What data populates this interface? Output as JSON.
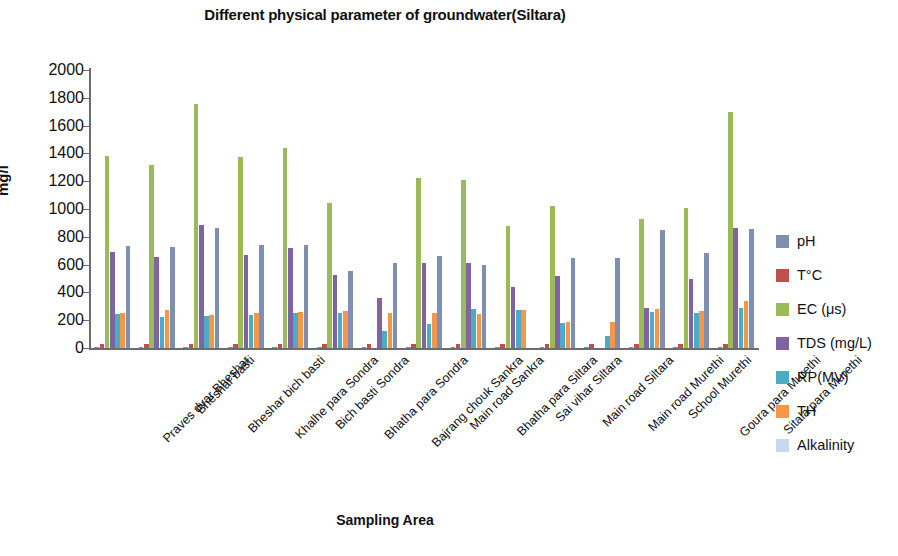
{
  "chart_data": {
    "type": "bar",
    "title": "Different physical parameter of groundwater(Siltara)",
    "xlabel": "Sampling Area",
    "ylabel": "mg/l",
    "ylim": [
      0,
      2000
    ],
    "ytick_step": 200,
    "yticks": [
      2000,
      1800,
      1600,
      1400,
      1200,
      1000,
      800,
      600,
      400,
      200,
      0
    ],
    "grid": false,
    "legend_position": "right",
    "categories": [
      "Praves dvar Bheshar",
      "Bheshar basti",
      "Bheshar bich basti",
      "Khalhe para Sondra",
      "Bich basti Sondra",
      "Bhatha para Sondra",
      "Bajrang chouk Sankra",
      "Main road Sankra",
      "Bhatha para Siltara",
      "Sai vihar Siltara",
      "Main road Siltara",
      "Main road Murethi",
      "School Murethi",
      "Goura para Murethi",
      "Sitala para Murethi"
    ],
    "series": [
      {
        "name": "pH",
        "color": "#7f8fb1",
        "values": [
          7.4,
          7.2,
          7.6,
          7.3,
          7.5,
          7.2,
          7.1,
          7.4,
          7.3,
          7.2,
          7.5,
          7.4,
          7.3,
          7.2,
          7.5
        ]
      },
      {
        "name": "T°C",
        "color": "#c0504d",
        "values": [
          28,
          28,
          29,
          28,
          29,
          28,
          27,
          28,
          28,
          27,
          28,
          28,
          29,
          28,
          29
        ]
      },
      {
        "name": "EC (μs)",
        "color": "#9bbb59",
        "values": [
          1385,
          1315,
          1755,
          1375,
          1440,
          1040,
          0,
          1225,
          1210,
          880,
          1020,
          0,
          930,
          1005,
          1695
        ]
      },
      {
        "name": "TDS (mg/L)",
        "color": "#8064a2",
        "values": [
          690,
          655,
          885,
          670,
          720,
          525,
          360,
          610,
          615,
          440,
          515,
          0,
          285,
          500,
          860
        ]
      },
      {
        "name": "RP(MV)",
        "color": "#4bacc6",
        "values": [
          245,
          225,
          230,
          240,
          250,
          255,
          120,
          175,
          280,
          270,
          180,
          90,
          260,
          255,
          290
        ]
      },
      {
        "name": "TH",
        "color": "#f79646",
        "values": [
          250,
          275,
          235,
          250,
          260,
          265,
          255,
          255,
          245,
          275,
          185,
          185,
          280,
          265,
          335
        ]
      },
      {
        "name": "Alkalinity",
        "color": "#c6d9f0",
        "values": [
          735,
          725,
          860,
          740,
          740,
          555,
          610,
          665,
          600,
          0,
          650,
          650,
          850,
          685,
          855
        ]
      }
    ],
    "note_alkalinity_rendered_as": "#7f8fb1"
  },
  "legend": {
    "items": [
      {
        "label": "pH",
        "color": "#7f8fb1"
      },
      {
        "label": "T°C",
        "color": "#c0504d"
      },
      {
        "label": "EC (μs)",
        "color": "#9bbb59"
      },
      {
        "label": "TDS (mg/L)",
        "color": "#8064a2"
      },
      {
        "label": "RP(MV)",
        "color": "#4bacc6"
      },
      {
        "label": "TH",
        "color": "#f79646"
      },
      {
        "label": "Alkalinity",
        "color": "#c6d9f0"
      }
    ]
  }
}
